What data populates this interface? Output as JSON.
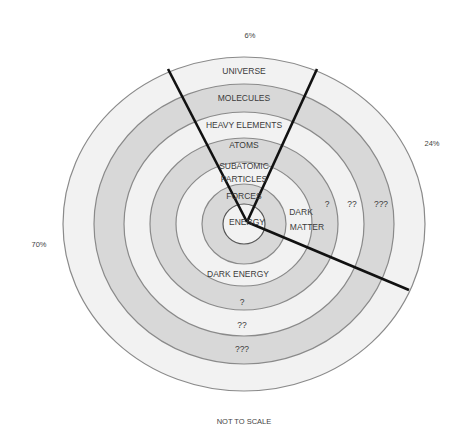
{
  "diagram": {
    "title_note": "NOT TO SCALE",
    "percentages": {
      "top": "6%",
      "right": "24%",
      "left": "70%"
    },
    "colors": {
      "light_ring": "#f1f1f1",
      "dark_ring": "#d6d6d6",
      "ring_stroke": "#8a8a8a",
      "divider": "#111111",
      "text": "#3a3a3a"
    },
    "rings_outer_to_inner": [
      "ring-7",
      "ring-6",
      "ring-5",
      "ring-4",
      "ring-3",
      "ring-2",
      "ring-1"
    ],
    "ordinary_matter_sector": {
      "labels": [
        "UNIVERSE",
        "MOLECULES",
        "HEAVY ELEMENTS",
        "ATOMS",
        "SUBATOMIC",
        "PARTICLES",
        "FORCES",
        "ENERGY"
      ]
    },
    "dark_matter_sector": {
      "labels": [
        "DARK",
        "MATTER",
        "?",
        "??",
        "???"
      ]
    },
    "dark_energy_sector": {
      "labels": [
        "DARK ENERGY",
        "?",
        "??",
        "???"
      ]
    }
  }
}
